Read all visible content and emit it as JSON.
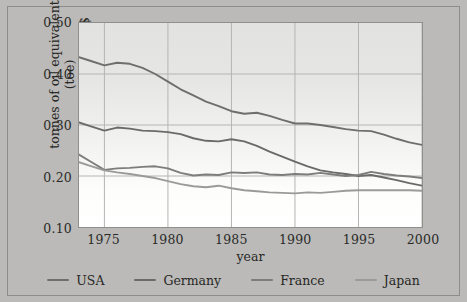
{
  "chart_data": {
    "type": "line",
    "title": "",
    "xlabel": "year",
    "ylabel": "tonnes of oil equivalent (toe) per thousand US$",
    "ylabel_line1": "tonnes of oil equivalent (toe)",
    "ylabel_line2": "per thousand US$",
    "xlim": [
      1973,
      2000
    ],
    "ylim": [
      0.1,
      0.5
    ],
    "grid": true,
    "legend_position": "bottom",
    "yticks": [
      "0.50",
      "0.40",
      "0.30",
      "0.20",
      "0.10"
    ],
    "ytick_values": [
      0.5,
      0.4,
      0.3,
      0.2,
      0.1
    ],
    "xticks": [
      "1975",
      "1980",
      "1985",
      "1990",
      "1995",
      "2000"
    ],
    "xtick_values": [
      1975,
      1980,
      1985,
      1990,
      1995,
      2000
    ],
    "x": [
      1973,
      1974,
      1975,
      1976,
      1977,
      1978,
      1979,
      1980,
      1981,
      1982,
      1983,
      1984,
      1985,
      1986,
      1987,
      1988,
      1989,
      1990,
      1991,
      1992,
      1993,
      1994,
      1995,
      1996,
      1997,
      1998,
      1999,
      2000
    ],
    "series": [
      {
        "name": "USA",
        "color": "#6e6e6c",
        "values": [
          0.433,
          0.425,
          0.417,
          0.422,
          0.42,
          0.412,
          0.4,
          0.385,
          0.37,
          0.358,
          0.346,
          0.337,
          0.327,
          0.322,
          0.324,
          0.318,
          0.31,
          0.303,
          0.303,
          0.3,
          0.296,
          0.292,
          0.289,
          0.288,
          0.281,
          0.273,
          0.266,
          0.261
        ]
      },
      {
        "name": "Germany",
        "color": "#6a6a68",
        "values": [
          0.305,
          0.297,
          0.289,
          0.295,
          0.293,
          0.289,
          0.288,
          0.286,
          0.282,
          0.274,
          0.269,
          0.268,
          0.272,
          0.268,
          0.259,
          0.248,
          0.238,
          0.228,
          0.219,
          0.211,
          0.207,
          0.204,
          0.2,
          0.202,
          0.197,
          0.192,
          0.186,
          0.181
        ]
      },
      {
        "name": "France",
        "color": "#7d7d7b",
        "values": [
          0.242,
          0.227,
          0.212,
          0.215,
          0.216,
          0.218,
          0.219,
          0.215,
          0.206,
          0.201,
          0.203,
          0.202,
          0.207,
          0.206,
          0.207,
          0.203,
          0.202,
          0.204,
          0.203,
          0.206,
          0.203,
          0.2,
          0.202,
          0.208,
          0.204,
          0.201,
          0.199,
          0.196
        ]
      },
      {
        "name": "Japan",
        "color": "#9a9a98",
        "values": [
          0.227,
          0.219,
          0.211,
          0.207,
          0.204,
          0.2,
          0.196,
          0.19,
          0.184,
          0.18,
          0.178,
          0.181,
          0.176,
          0.172,
          0.17,
          0.168,
          0.167,
          0.166,
          0.168,
          0.167,
          0.169,
          0.171,
          0.172,
          0.172,
          0.172,
          0.172,
          0.172,
          0.171
        ]
      }
    ]
  },
  "legend": {
    "items": [
      {
        "label": "USA",
        "color": "#6e6e6c"
      },
      {
        "label": "Germany",
        "color": "#6a6a68"
      },
      {
        "label": "France",
        "color": "#7d7d7b"
      },
      {
        "label": "Japan",
        "color": "#9a9a98"
      }
    ]
  },
  "style": {
    "background": "#bbbab8",
    "plot_background": "#eeeeec",
    "grid_color": "#b4b4b2",
    "axis_color": "#6e6e6c",
    "text_color": "#272725"
  }
}
